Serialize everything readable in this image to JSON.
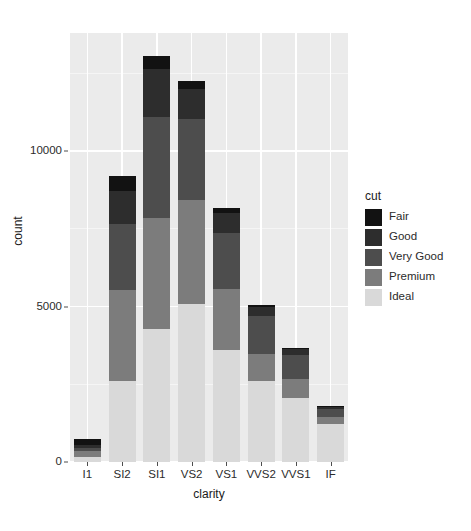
{
  "chart_data": {
    "type": "bar",
    "stacked": true,
    "title": "",
    "subtitle": "",
    "xlabel": "clarity",
    "ylabel": "count",
    "categories": [
      "I1",
      "SI2",
      "SI1",
      "VS2",
      "VS1",
      "VVS2",
      "VVS1",
      "IF"
    ],
    "series": [
      {
        "name": "Fair",
        "color": "#121212",
        "values": [
          210,
          466,
          408,
          261,
          170,
          69,
          17,
          9
        ]
      },
      {
        "name": "Good",
        "color": "#2d2d2d",
        "values": [
          96,
          1081,
          1560,
          978,
          648,
          286,
          186,
          71
        ]
      },
      {
        "name": "Very Good",
        "color": "#4d4d4d",
        "values": [
          84,
          2100,
          3240,
          2591,
          1775,
          1235,
          789,
          268
        ]
      },
      {
        "name": "Premium",
        "color": "#7c7c7c",
        "values": [
          205,
          2949,
          3575,
          3357,
          1989,
          870,
          616,
          230
        ]
      },
      {
        "name": "Ideal",
        "color": "#d9d9d9",
        "values": [
          146,
          2598,
          4282,
          5071,
          3589,
          2606,
          2047,
          1212
        ]
      }
    ],
    "totals": [
      741,
      9194,
      13065,
      12258,
      8171,
      5066,
      3655,
      1790
    ],
    "ylim": [
      0,
      13800
    ],
    "y_ticks": [
      0,
      5000,
      10000
    ],
    "y_tick_labels": [
      "0",
      "5000",
      "10000"
    ],
    "grid": true,
    "grid_color": "#ffffff",
    "panel_background": "#ebebeb",
    "legend": {
      "title": "cut",
      "position": "right",
      "entries": [
        "Fair",
        "Good",
        "Very Good",
        "Premium",
        "Ideal"
      ]
    }
  },
  "axes": {
    "y_title": "count",
    "x_title": "clarity"
  },
  "legend": {
    "title": "cut"
  }
}
